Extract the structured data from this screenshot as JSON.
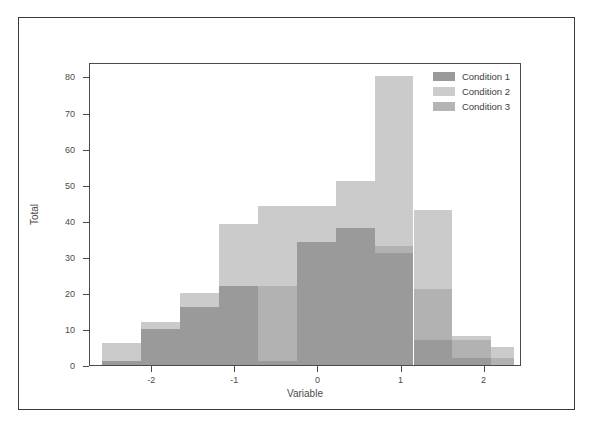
{
  "chart_data": {
    "type": "bar",
    "title": "",
    "xlabel": "Variable",
    "ylabel": "Total",
    "xlim": [
      -2.75,
      2.45
    ],
    "ylim": [
      0,
      84
    ],
    "grid": false,
    "legend_position": "top-right",
    "bin_width": 0.468,
    "bin_edges": [
      -2.6,
      -2.132,
      -1.664,
      -1.196,
      -0.728,
      -0.26,
      0.208,
      0.676,
      1.144,
      1.612,
      2.08,
      2.35
    ],
    "x_ticks": [
      -2,
      -1,
      0,
      1,
      2
    ],
    "x_tick_labels": [
      "-2",
      "-1",
      "0",
      "1",
      "2"
    ],
    "y_ticks": [
      0,
      10,
      20,
      30,
      40,
      50,
      60,
      70,
      80
    ],
    "y_tick_labels": [
      "0",
      "10",
      "20",
      "30",
      "40",
      "50",
      "60",
      "70",
      "80"
    ],
    "bars": [
      {
        "x0": -2.6,
        "x1": -2.132,
        "outer": 6,
        "mid": 1,
        "inner": 1
      },
      {
        "x0": -2.132,
        "x1": -1.664,
        "outer": 12,
        "mid": 10,
        "inner": 10
      },
      {
        "x0": -1.664,
        "x1": -1.196,
        "outer": 20,
        "mid": 16,
        "inner": 16
      },
      {
        "x0": -1.196,
        "x1": -0.728,
        "outer": 39,
        "mid": 22,
        "inner": 22
      },
      {
        "x0": -0.728,
        "x1": -0.26,
        "outer": 44,
        "mid": 22,
        "inner": 1
      },
      {
        "x0": -0.26,
        "x1": 0.208,
        "outer": 44,
        "mid": 34,
        "inner": 34
      },
      {
        "x0": 0.208,
        "x1": 0.676,
        "outer": 51,
        "mid": 38,
        "inner": 38
      },
      {
        "x0": 0.676,
        "x1": 1.144,
        "outer": 80,
        "mid": 33,
        "inner": 31
      },
      {
        "x0": 1.144,
        "x1": 1.612,
        "outer": 43,
        "mid": 21,
        "inner": 7
      },
      {
        "x0": 1.612,
        "x1": 2.08,
        "outer": 8,
        "mid": 7,
        "inner": 2
      },
      {
        "x0": 2.08,
        "x1": 2.35,
        "outer": 5,
        "mid": 2,
        "inner": 0
      }
    ],
    "series": [
      {
        "name": "Condition 1",
        "color": "#9a9a9a",
        "categories": [
          "-2.37",
          "-1.90",
          "-1.43",
          "-0.96",
          "-0.49",
          "-0.03",
          "0.44",
          "0.91",
          "1.38",
          "1.85",
          "2.22"
        ],
        "values": [
          1,
          10,
          16,
          22,
          22,
          34,
          38,
          31,
          7,
          2,
          0
        ]
      },
      {
        "name": "Condition 2",
        "color": "#cccccc",
        "categories": [
          "-2.37",
          "-1.90",
          "-1.43",
          "-0.96",
          "-0.49",
          "-0.03",
          "0.44",
          "0.91",
          "1.38",
          "1.85",
          "2.22"
        ],
        "values": [
          6,
          12,
          20,
          39,
          44,
          44,
          51,
          80,
          43,
          8,
          5
        ]
      },
      {
        "name": "Condition 3",
        "color": "#b4b4b4",
        "categories": [
          "-2.37",
          "-1.90",
          "-1.43",
          "-0.96",
          "-0.49",
          "-0.03",
          "0.44",
          "0.91",
          "1.38",
          "1.85",
          "2.22"
        ],
        "values": [
          1,
          10,
          16,
          22,
          22,
          34,
          38,
          33,
          21,
          7,
          2
        ]
      }
    ]
  },
  "legend": {
    "items": [
      {
        "label": "Condition 1",
        "color": "#9a9a9a"
      },
      {
        "label": "Condition 2",
        "color": "#cccccc"
      },
      {
        "label": "Condition 3",
        "color": "#b4b4b4"
      }
    ]
  },
  "colors": {
    "light": "#cbcbcb",
    "mid": "#b2b2b2",
    "dark": "#9a9a9a",
    "axis": "#4a4a4a",
    "text": "#4b4b4b",
    "frame": "#3a3a3a",
    "background": "#ffffff"
  }
}
